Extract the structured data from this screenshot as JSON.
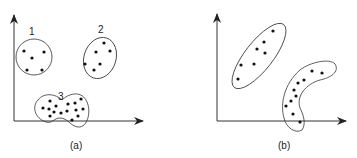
{
  "panels": [
    {
      "caption": "(a)",
      "clusters": [
        {
          "label": "1",
          "shape": "ellipse"
        },
        {
          "label": "2",
          "shape": "ellipse"
        },
        {
          "label": "3",
          "shape": "peanut"
        }
      ]
    },
    {
      "caption": "(b)",
      "clusters": [
        {
          "label": "",
          "shape": "elongated-ellipse"
        },
        {
          "label": "",
          "shape": "crescent"
        }
      ]
    }
  ],
  "colors": {
    "stroke": "#333333",
    "point": "#111111",
    "background": "#ffffff"
  }
}
